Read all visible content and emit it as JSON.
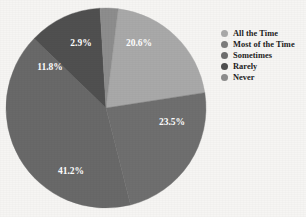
{
  "chart_data": {
    "type": "pie",
    "title": "",
    "subtitle": "",
    "xlabel": "",
    "ylabel": "",
    "legend_position": "right",
    "grid": false,
    "categories": [
      "All the Time",
      "Most of the Time",
      "Sometimes",
      "Rarely",
      "Never"
    ],
    "values": [
      20.6,
      23.5,
      41.2,
      11.8,
      2.9
    ],
    "value_labels": [
      "20.6%",
      "23.5%",
      "41.2%",
      "11.8%",
      "2.9%"
    ],
    "colors": [
      "#a9a9a9",
      "#6f6f6f",
      "#696969",
      "#505050",
      "#8d8d8d"
    ],
    "slices": [
      {
        "label": "All the Time",
        "value": 20.6,
        "display": "20.6%",
        "color": "#a9a9a9",
        "start_deg": 7,
        "end_deg": 81.16
      },
      {
        "label": "Most of the Time",
        "value": 23.5,
        "display": "23.5%",
        "color": "#6f6f6f",
        "start_deg": 81.16,
        "end_deg": 165.76
      },
      {
        "label": "Sometimes",
        "value": 41.2,
        "display": "41.2%",
        "color": "#696969",
        "start_deg": 165.76,
        "end_deg": 314.08
      },
      {
        "label": "Rarely",
        "value": 11.8,
        "display": "11.8%",
        "color": "#505050",
        "start_deg": 314.08,
        "end_deg": 356.56
      },
      {
        "label": "Never",
        "value": 2.9,
        "display": "2.9%",
        "color": "#8d8d8d",
        "start_deg": 356.56,
        "end_deg": 367
      }
    ]
  },
  "legend": {
    "items": [
      {
        "label": "All the Time",
        "color": "#a9a9a9"
      },
      {
        "label": "Most of the Time",
        "color": "#7c7c7c"
      },
      {
        "label": "Sometimes",
        "color": "#6e6e6e"
      },
      {
        "label": "Rarely",
        "color": "#4f4f4f"
      },
      {
        "label": "Never",
        "color": "#8d8d8d"
      }
    ]
  },
  "geometry": {
    "cx": 106,
    "cy": 108,
    "r": 100
  },
  "labels": {
    "positions": [
      {
        "text": "20.6%",
        "x": 139,
        "y": 44
      },
      {
        "text": "23.5%",
        "x": 172,
        "y": 123
      },
      {
        "text": "41.2%",
        "x": 71,
        "y": 172
      },
      {
        "text": "11.8%",
        "x": 50,
        "y": 68
      },
      {
        "text": "2.9%",
        "x": 81,
        "y": 44
      }
    ]
  }
}
